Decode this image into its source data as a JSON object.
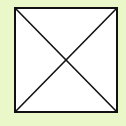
{
  "background_color": "#e9f7c9",
  "box": {
    "fill": "#ffffff",
    "stroke": "#111111",
    "shape": "square-with-diagonals"
  },
  "icon": "crossed-box-icon"
}
